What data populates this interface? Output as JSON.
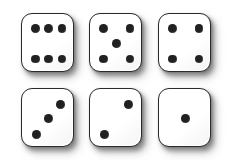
{
  "scene": {
    "title": "Six dice arrangement",
    "background_color": "#ffffff",
    "die_face_color": "#ffffff",
    "die_border_color": "#2b2b2b",
    "pip_color": "#212121",
    "shadow_color": "#7a7a7a",
    "rows": 2,
    "columns": 3,
    "total_dice": 6,
    "total_pips": 21
  },
  "dice": [
    {
      "index": 1,
      "value": 6,
      "value_label": "6",
      "row": 1,
      "column": 1,
      "pip_layout": "two-columns-of-three",
      "pip_positions": [
        "top-left",
        "top-center",
        "top-right",
        "bottom-left",
        "bottom-center",
        "bottom-right"
      ]
    },
    {
      "index": 2,
      "value": 5,
      "value_label": "5",
      "row": 1,
      "column": 2,
      "pip_layout": "four-corners-plus-center",
      "pip_positions": [
        "top-left",
        "top-right",
        "middle-center",
        "bottom-left",
        "bottom-right"
      ]
    },
    {
      "index": 3,
      "value": 4,
      "value_label": "4",
      "row": 1,
      "column": 3,
      "pip_layout": "four-corners",
      "pip_positions": [
        "top-left",
        "top-right",
        "bottom-left",
        "bottom-right"
      ]
    },
    {
      "index": 4,
      "value": 3,
      "value_label": "3",
      "row": 2,
      "column": 1,
      "pip_layout": "anti-diagonal",
      "pip_positions": [
        "bottom-left",
        "middle-center",
        "top-right"
      ]
    },
    {
      "index": 5,
      "value": 2,
      "value_label": "2",
      "row": 2,
      "column": 2,
      "pip_layout": "anti-diagonal",
      "pip_positions": [
        "bottom-left",
        "top-right"
      ]
    },
    {
      "index": 6,
      "value": 1,
      "value_label": "1",
      "row": 2,
      "column": 3,
      "pip_layout": "center",
      "pip_positions": [
        "middle-center"
      ]
    }
  ]
}
